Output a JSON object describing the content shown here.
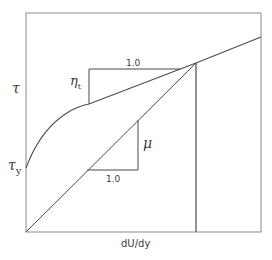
{
  "diagram": {
    "title": "",
    "y_axis_label": "τ",
    "x_axis_label": "dU/dy",
    "yield_stress_label": "τ",
    "yield_stress_subscript": "y",
    "turbulent_slope_label": "η",
    "turbulent_slope_subscript": "t",
    "laminar_slope_label": "μ",
    "upper_triangle_run_label": "1.0",
    "lower_triangle_run_label": "1.0",
    "colors": {
      "line": "#4a4a4a",
      "frame": "#8a8a8a",
      "background": "#ffffff"
    },
    "curves": [
      {
        "name": "bingham-type flow curve",
        "description": "starts at yield stress τy, curves upward then becomes linear with slope η_t"
      },
      {
        "name": "newtonian line",
        "description": "straight line from origin with slope μ"
      }
    ],
    "intersection_marker": "vertical line at intersection of the two curves"
  }
}
